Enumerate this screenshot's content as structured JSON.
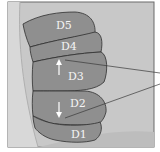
{
  "diagram": {
    "segments": [
      {
        "id": "D5",
        "label": "D5"
      },
      {
        "id": "D4",
        "label": "D4"
      },
      {
        "id": "D3",
        "label": "D3",
        "arrow": "up"
      },
      {
        "id": "D2",
        "label": "D2",
        "arrow": "down"
      },
      {
        "id": "D1",
        "label": "D1"
      }
    ],
    "colors": {
      "background": "#c6c6c6",
      "segment_fill": "#8f8f8f",
      "segment_stroke": "#2e2e2e",
      "frame": "#6a6a6a",
      "leader_line": "#3a3a3a",
      "arrow": "#ffffff"
    }
  }
}
